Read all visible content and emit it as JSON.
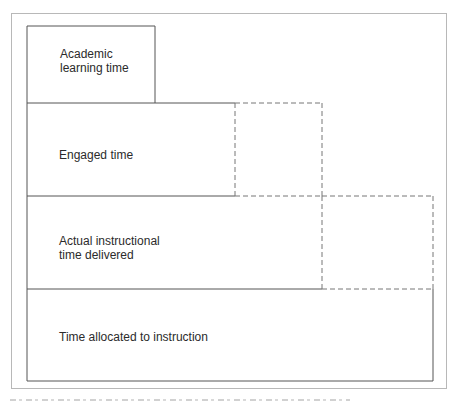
{
  "diagram": {
    "type": "nested-time-blocks",
    "levels": [
      {
        "id": "academic",
        "label_lines": [
          "Academic",
          "learning time"
        ]
      },
      {
        "id": "engaged",
        "label_lines": [
          "Engaged time"
        ]
      },
      {
        "id": "actual",
        "label_lines": [
          "Actual instructional",
          "time delivered"
        ]
      },
      {
        "id": "allocated",
        "label_lines": [
          "Time allocated to instruction"
        ]
      }
    ],
    "line_color": "#555555",
    "dashed_color": "#777777",
    "frame_color": "#b8b8b8"
  }
}
